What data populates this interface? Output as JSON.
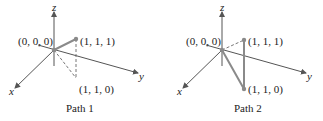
{
  "diagrams": [
    {
      "caption": "Path 1",
      "axes": {
        "x": "x",
        "y": "y",
        "z": "z"
      },
      "points": {
        "origin": "(0, 0, 0)",
        "top": "(1, 1, 1)",
        "bottom": "(1, 1, 0)"
      },
      "segments": [
        {
          "from": "(0, 0, 0)",
          "to": "(1, 1, 1)",
          "style": "solid"
        },
        {
          "from": "(0, 0, 0)",
          "to": "(1, 1, 0)",
          "style": "dashed"
        },
        {
          "from": "(1, 1, 1)",
          "to": "(1, 1, 0)",
          "style": "dashed"
        }
      ]
    },
    {
      "caption": "Path 2",
      "axes": {
        "x": "x",
        "y": "y",
        "z": "z"
      },
      "points": {
        "origin": "(0, 0, 0)",
        "top": "(1, 1, 1)",
        "bottom": "(1, 1, 0)"
      },
      "segments": [
        {
          "from": "(0, 0, 0)",
          "to": "(1, 1, 1)",
          "style": "dashed"
        },
        {
          "from": "(0, 0, 0)",
          "to": "(1, 1, 0)",
          "style": "solid"
        },
        {
          "from": "(1, 1, 0)",
          "to": "(1, 1, 1)",
          "style": "solid"
        }
      ]
    }
  ],
  "colors": {
    "axis": "#555555",
    "path": "#8a8a8a",
    "point": "#8a8a8a",
    "text": "#222222"
  }
}
